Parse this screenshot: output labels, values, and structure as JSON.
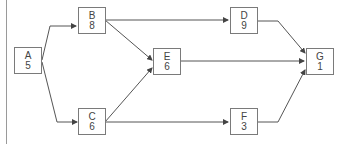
{
  "diagram": {
    "type": "activity-network",
    "nodes": [
      {
        "id": "A",
        "label": "A",
        "value": "5"
      },
      {
        "id": "B",
        "label": "B",
        "value": "8"
      },
      {
        "id": "C",
        "label": "C",
        "value": "6"
      },
      {
        "id": "D",
        "label": "D",
        "value": "9"
      },
      {
        "id": "E",
        "label": "E",
        "value": "6"
      },
      {
        "id": "F",
        "label": "F",
        "value": "3"
      },
      {
        "id": "G",
        "label": "G",
        "value": "1"
      }
    ],
    "edges": [
      {
        "from": "A",
        "to": "B"
      },
      {
        "from": "A",
        "to": "C"
      },
      {
        "from": "B",
        "to": "D"
      },
      {
        "from": "B",
        "to": "E"
      },
      {
        "from": "C",
        "to": "E"
      },
      {
        "from": "C",
        "to": "F"
      },
      {
        "from": "D",
        "to": "G"
      },
      {
        "from": "E",
        "to": "G"
      },
      {
        "from": "F",
        "to": "G"
      }
    ]
  }
}
